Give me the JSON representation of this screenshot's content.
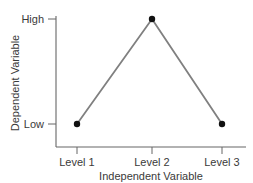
{
  "chart_data": {
    "type": "line",
    "title": "",
    "xlabel": "Independent Variable",
    "ylabel": "Dependent Variable",
    "categories": [
      "Level 1",
      "Level 2",
      "Level 3"
    ],
    "values": [
      0,
      1,
      0
    ],
    "ytick_labels": [
      "Low",
      "High"
    ],
    "ytick_values": [
      0,
      1
    ],
    "ylim": [
      0,
      1
    ],
    "grid": false,
    "legend": false,
    "legend_position": "none",
    "series": [
      {
        "name": "",
        "values": [
          0,
          1,
          0
        ],
        "line_color": "#808080",
        "marker_color": "#111111",
        "marker": "circle"
      }
    ],
    "annotations": []
  },
  "axes": {
    "x_tick_labels": [
      "Level 1",
      "Level 2",
      "Level 3"
    ],
    "y_tick_labels": {
      "high": "High",
      "low": "Low"
    },
    "x_axis_label": "Independent Variable",
    "y_axis_label": "Dependent Variable"
  },
  "colors": {
    "background": "#ffffff",
    "text": "#3a3a3a",
    "axis_line": "#666666",
    "data_line": "#808080",
    "marker_fill": "#111111"
  }
}
